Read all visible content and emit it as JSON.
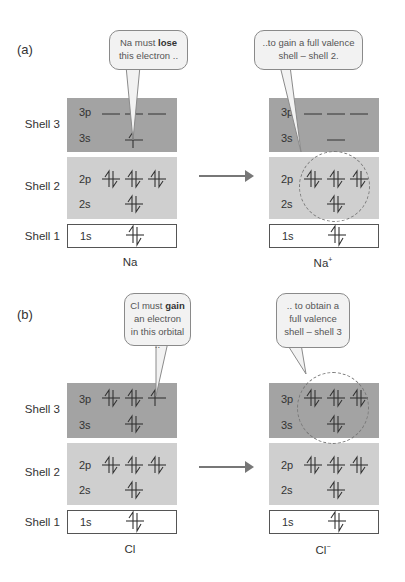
{
  "parts": [
    {
      "label": "(a)",
      "before": {
        "species": "Na",
        "species_charge": "",
        "callout": {
          "pre": "Na must ",
          "bold": "lose",
          "post": " this electron ..",
          "icon": "speech-bubble"
        }
      },
      "after": {
        "species": "Na",
        "species_charge": "+",
        "callout": {
          "text": "..to gain a full valence shell – shell 2."
        }
      }
    },
    {
      "label": "(b)",
      "before": {
        "species": "Cl",
        "species_charge": "",
        "callout": {
          "pre": "Cl must ",
          "bold": "gain",
          "post": " an electron in this orbital .."
        }
      },
      "after": {
        "species": "Cl",
        "species_charge": "−",
        "callout": {
          "text": ".. to obtain a full valence shell – shell 3"
        }
      }
    }
  ],
  "shells": {
    "shell3": "Shell 3",
    "shell2": "Shell 2",
    "shell1": "Shell 1"
  },
  "orbitals": {
    "o3p": "3p",
    "o3s": "3s",
    "o2p": "2p",
    "o2s": "2s",
    "o1s": "1s"
  },
  "configs": {
    "Na": {
      "3p": [
        "empty",
        "empty",
        "empty"
      ],
      "3s": [
        "up"
      ],
      "2p": [
        "pair",
        "pair",
        "pair"
      ],
      "2s": [
        "pair"
      ],
      "1s": [
        "pair"
      ]
    },
    "Na+": {
      "3p": [
        "empty",
        "empty",
        "empty"
      ],
      "3s": [
        "empty"
      ],
      "2p": [
        "pair",
        "pair",
        "pair"
      ],
      "2s": [
        "pair"
      ],
      "1s": [
        "pair"
      ]
    },
    "Cl": {
      "3p": [
        "pair",
        "pair",
        "up"
      ],
      "3s": [
        "pair"
      ],
      "2p": [
        "pair",
        "pair",
        "pair"
      ],
      "2s": [
        "pair"
      ],
      "1s": [
        "pair"
      ]
    },
    "Cl-": {
      "3p": [
        "pair",
        "pair",
        "pair"
      ],
      "3s": [
        "pair"
      ],
      "2p": [
        "pair",
        "pair",
        "pair"
      ],
      "2s": [
        "pair"
      ],
      "1s": [
        "pair"
      ]
    }
  },
  "colors": {
    "shell3_band": "#a3a3a3",
    "shell2_band": "#cfcfcf",
    "shell1_band": "#ffffff",
    "bubble_fill": "#f2f2f2"
  }
}
